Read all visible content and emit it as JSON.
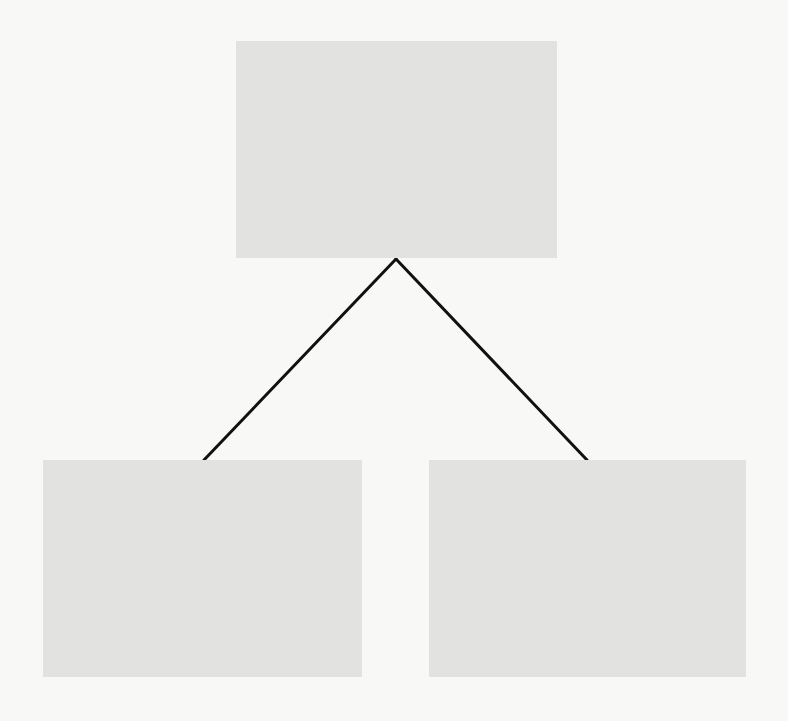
{
  "diagram": {
    "type": "tree",
    "background_color": "#f8f8f7",
    "node_color": "#e2e2e1",
    "edge_color": "#111111",
    "nodes": [
      {
        "id": "root",
        "label": "",
        "x": 236,
        "y": 41,
        "width": 321,
        "height": 217
      },
      {
        "id": "left",
        "label": "",
        "x": 43,
        "y": 460,
        "width": 319,
        "height": 217
      },
      {
        "id": "right",
        "label": "",
        "x": 429,
        "y": 460,
        "width": 317,
        "height": 217
      }
    ],
    "edges": [
      {
        "from": "root",
        "to": "left",
        "x1": 396,
        "y1": 259,
        "x2": 204,
        "y2": 460
      },
      {
        "from": "root",
        "to": "right",
        "x1": 396,
        "y1": 259,
        "x2": 587,
        "y2": 460
      }
    ]
  }
}
